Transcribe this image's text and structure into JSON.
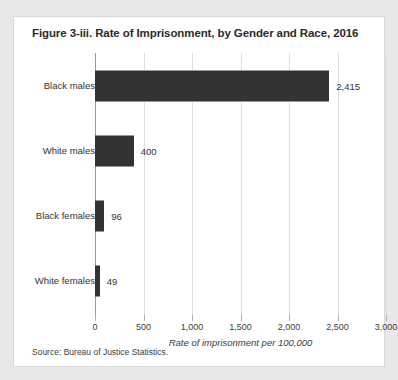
{
  "figure": {
    "title": "Figure 3-iii. Rate of Imprisonment, by Gender and Race, 2016",
    "source_note": "Source: Bureau of Justice Statistics."
  },
  "colors": {
    "bar": "#333333",
    "card_background": "#ffffff",
    "page_background": "#e8e8e8",
    "gridline": "#dedede",
    "axis": "#9a9a9a",
    "text": "#333333"
  },
  "chart_data": {
    "type": "bar",
    "orientation": "horizontal",
    "title": "Figure 3-iii. Rate of Imprisonment, by Gender and Race, 2016",
    "categories": [
      "Black males",
      "White males",
      "Black females",
      "White females"
    ],
    "values": [
      2415,
      400,
      96,
      49
    ],
    "value_labels": [
      "2,415",
      "400",
      "96",
      "49"
    ],
    "xlabel": "Rate of imprisonment per 100,000",
    "ylabel": "",
    "xlim": [
      0,
      3000
    ],
    "xticks": [
      0,
      500,
      1000,
      1500,
      2000,
      2500,
      3000
    ],
    "xticklabels": [
      "0",
      "500",
      "1,000",
      "1,500",
      "2,000",
      "2,500",
      "3,000"
    ],
    "grid": true,
    "legend": false,
    "series": [
      {
        "name": "Rate of imprisonment per 100,000",
        "values": [
          2415,
          400,
          96,
          49
        ]
      }
    ]
  }
}
